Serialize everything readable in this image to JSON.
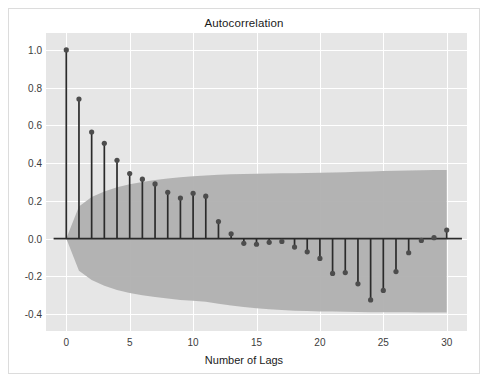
{
  "figure": {
    "width": 488,
    "height": 385,
    "background_color": "#ffffff",
    "frame_color": "#dcdcdc",
    "plot_background_color": "#e6e6e6",
    "grid_color": "#ffffff"
  },
  "chart_data": {
    "type": "line",
    "plot_kind": "autocorrelation-stem",
    "title": "Autocorrelation",
    "xlabel": "Number of Lags",
    "ylabel": "",
    "grid": true,
    "legend": null,
    "xlim": [
      -1.6,
      31.6
    ],
    "ylim": [
      -0.49,
      1.09
    ],
    "xticks": [
      0,
      5,
      10,
      15,
      20,
      25,
      30
    ],
    "xticklabels": [
      "0",
      "5",
      "10",
      "15",
      "20",
      "25",
      "30"
    ],
    "yticks": [
      -0.4,
      -0.2,
      0.0,
      0.2,
      0.4,
      0.6,
      0.8,
      1.0
    ],
    "yticklabels": [
      "-0.4",
      "-0.2",
      "0.0",
      "0.2",
      "0.4",
      "0.6",
      "0.8",
      "1.0"
    ],
    "marker_color": "#4d4d4d",
    "stem_color": "#2b2b2b",
    "baseline_color": "#2b2b2b",
    "confidence_band_color": "#b0b0b0",
    "confidence_band_opacity": 0.95,
    "x": [
      0,
      1,
      2,
      3,
      4,
      5,
      6,
      7,
      8,
      9,
      10,
      11,
      12,
      13,
      14,
      15,
      16,
      17,
      18,
      19,
      20,
      21,
      22,
      23,
      24,
      25,
      26,
      27,
      28,
      29,
      30
    ],
    "values": [
      1.0,
      0.74,
      0.565,
      0.505,
      0.415,
      0.345,
      0.315,
      0.29,
      0.245,
      0.215,
      0.24,
      0.225,
      0.09,
      0.025,
      -0.025,
      -0.03,
      -0.02,
      -0.015,
      -0.045,
      -0.07,
      -0.105,
      -0.185,
      -0.18,
      -0.24,
      -0.325,
      -0.275,
      -0.175,
      -0.075,
      -0.01,
      0.005,
      0.045
    ],
    "confidence_upper": [
      0.0,
      0.17,
      0.22,
      0.25,
      0.272,
      0.288,
      0.3,
      0.31,
      0.318,
      0.325,
      0.33,
      0.335,
      0.339,
      0.341,
      0.343,
      0.344,
      0.345,
      0.346,
      0.347,
      0.348,
      0.349,
      0.35,
      0.352,
      0.354,
      0.356,
      0.358,
      0.36,
      0.361,
      0.362,
      0.363,
      0.364
    ],
    "confidence_lower": [
      0.0,
      -0.17,
      -0.22,
      -0.25,
      -0.272,
      -0.288,
      -0.3,
      -0.31,
      -0.318,
      -0.325,
      -0.33,
      -0.335,
      -0.345,
      -0.355,
      -0.363,
      -0.37,
      -0.375,
      -0.379,
      -0.382,
      -0.384,
      -0.386,
      -0.387,
      -0.388,
      -0.389,
      -0.39,
      -0.39,
      -0.391,
      -0.391,
      -0.392,
      -0.392,
      -0.392
    ]
  }
}
